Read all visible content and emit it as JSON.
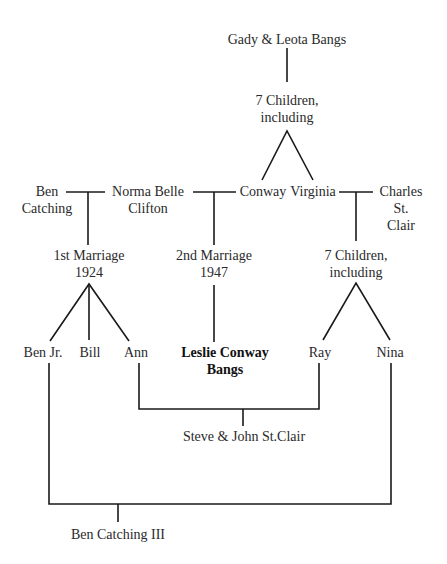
{
  "diagram": {
    "type": "family-tree",
    "nodes": {
      "grandparents": "Gady & Leota Bangs",
      "bangs_children": "7  Children,\nincluding",
      "ben_catching": "Ben\nCatching",
      "norma_belle": "Norma Belle\nClifton",
      "conway": "Conway",
      "virginia": "Virginia",
      "charles": "Charles\nSt. Clair",
      "first_marriage": "1st Marriage\n1924",
      "second_marriage": "2nd Marriage\n1947",
      "stclair_children": "7 Children,\nincluding",
      "ben_jr": "Ben Jr.",
      "bill": "Bill",
      "ann": "Ann",
      "leslie": "Leslie Conway\nBangs",
      "ray": "Ray",
      "nina": "Nina",
      "steve_john": "Steve & John St.Clair",
      "ben_iii": "Ben Catching III"
    },
    "relationships": [
      {
        "from": "Gady & Leota Bangs",
        "to": "7 Children, including"
      },
      {
        "from": "7 Children, including",
        "to": [
          "Conway",
          "Virginia"
        ]
      },
      {
        "marriage": [
          "Ben Catching",
          "Norma Belle Clifton"
        ],
        "label": "1st Marriage 1924",
        "children": [
          "Ben Jr.",
          "Bill",
          "Ann"
        ]
      },
      {
        "marriage": [
          "Norma Belle Clifton",
          "Conway"
        ],
        "label": "2nd Marriage 1947",
        "children": [
          "Leslie Conway Bangs"
        ]
      },
      {
        "marriage": [
          "Virginia",
          "Charles St. Clair"
        ],
        "label": "7 Children, including",
        "children": [
          "Ray",
          "Nina"
        ]
      },
      {
        "union": [
          "Ann",
          "Ray"
        ],
        "children": [
          "Steve & John St.Clair"
        ]
      },
      {
        "union": [
          "Ben Jr.",
          "Nina"
        ],
        "children": [
          "Ben Catching III"
        ]
      }
    ],
    "highlighted": "Leslie Conway Bangs"
  }
}
